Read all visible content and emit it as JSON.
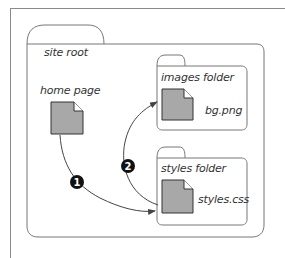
{
  "diagram": {
    "folders": [
      {
        "id": "site-root",
        "label": "site root"
      },
      {
        "id": "images-folder",
        "label": "images folder"
      },
      {
        "id": "styles-folder",
        "label": "styles folder"
      }
    ],
    "files": [
      {
        "id": "home-page",
        "label": "home page",
        "folder": "site-root"
      },
      {
        "id": "bg-png",
        "label": "bg.png",
        "folder": "images-folder"
      },
      {
        "id": "styles-css",
        "label": "styles.css",
        "folder": "styles-folder"
      }
    ],
    "steps": [
      {
        "number": "1",
        "from": "home-page",
        "to": "styles-css"
      },
      {
        "number": "2",
        "from": "styles-css",
        "to": "bg-png"
      }
    ],
    "colors": {
      "file_fill": "#a8a8a8",
      "stroke": "#555555",
      "badge": "#111111"
    }
  }
}
